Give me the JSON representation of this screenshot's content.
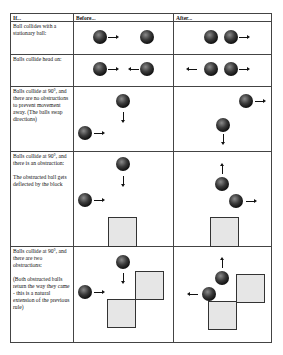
{
  "headers": {
    "if": "If...",
    "before": "Before...",
    "after": "After..."
  },
  "rows": [
    {
      "label": "Ball collides with a stationary ball:"
    },
    {
      "label": "Balls collide head on:"
    },
    {
      "label": "Balls collide at 90°, and there are no obstructions to prevent movement away. (The balls swap directions)"
    },
    {
      "label": "Balls collide at 90°, and there is an obstruction:\n\nThe obstructed ball gets deflected by the block"
    },
    {
      "label": "Balls collide at 90°, and there are two obstructions:\n\n(Both obstructed balls return the way they came - this is a natural extension of the previous rule)"
    }
  ],
  "colors": {
    "border": "#444444",
    "ball": "#1a1a1a",
    "block_fill": "#e6e6e6",
    "block_border": "#333333"
  }
}
